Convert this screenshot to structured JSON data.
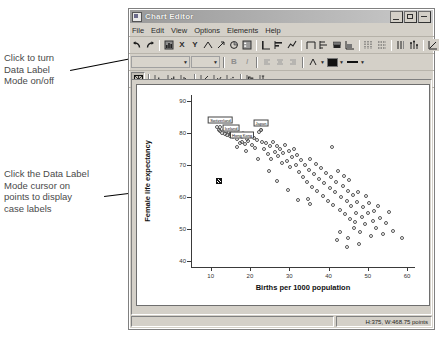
{
  "window": {
    "title": "Chart Editor",
    "icon": "chart-window-icon",
    "buttons": [
      {
        "name": "minimize",
        "glyph": "_"
      },
      {
        "name": "maximize",
        "glyph": "□"
      },
      {
        "name": "close",
        "glyph": "×"
      }
    ]
  },
  "menu": {
    "items": [
      "File",
      "Edit",
      "View",
      "Options",
      "Elements",
      "Help"
    ]
  },
  "toolbar1": {
    "groups": [
      [
        "undo-icon",
        "redo-icon"
      ],
      [
        "chart-properties-icon",
        "x-axis-icon",
        "y-axis-icon",
        "scale-axis-icon",
        "rotate-icon",
        "pie-icon",
        "legend-icon"
      ],
      [
        "bar-vertical-icon",
        "bar-horizontal-icon",
        "line-icon"
      ],
      [
        "area-outline-icon",
        "area-left-icon",
        "stacked-bar-icon",
        "stacked-area-icon"
      ],
      [
        "grid-major-icon",
        "grid-minor-icon"
      ],
      [
        "reference-line-icon",
        "spike-icon"
      ],
      [
        "fit-line-icon",
        "transpose-icon"
      ]
    ]
  },
  "toolbar2": {
    "font_combo_value": "",
    "size_combo_value": "",
    "bold_label": "B",
    "italic_label": "I",
    "align_icons": [
      "align-left-icon",
      "align-center-icon",
      "align-right-icon"
    ],
    "text_color_icon": "text-color-icon",
    "fill_color_swatch": "#111111",
    "line_style_icon": "line-style-icon"
  },
  "toolbar3": {
    "data_label_mode_icon": "data-label-mode-icon",
    "data_label_mode_pressed": true,
    "icons": [
      "bar-chart-icon",
      "bar-chart-alt-icon",
      "histogram-icon",
      "scatter-icon",
      "scatter-matrix-icon",
      "dot-plot-icon",
      "boxplot-icon",
      "error-bar-icon"
    ]
  },
  "annotations": [
    {
      "name": "callout-data-label-toggle",
      "text": "Click to turn\nData Label\nMode on/off"
    },
    {
      "name": "callout-data-label-cursor",
      "text": "Click the Data Label\nMode cursor on\npoints to display\ncase labels"
    }
  ],
  "statusbar": {
    "dimensions": "H:375, W:468.75 points"
  },
  "chart_data": {
    "type": "scatter",
    "title": "",
    "xlabel": "Births per 1000 population",
    "ylabel": "Female life expectancy",
    "xlim": [
      5,
      62
    ],
    "ylim": [
      38,
      92
    ],
    "xticks": [
      10,
      20,
      30,
      40,
      50,
      60
    ],
    "yticks": [
      40,
      50,
      60,
      70,
      80,
      90
    ],
    "grid": false,
    "legend": null,
    "marker": "open-circle",
    "point_labels": [
      {
        "label": "Switzerland",
        "x": 12.5,
        "y": 82.0
      },
      {
        "label": "Iceland",
        "x": 15.2,
        "y": 79.3
      },
      {
        "label": "Hong Kong",
        "x": 18.0,
        "y": 77.3
      },
      {
        "label": "Japan",
        "x": 22.8,
        "y": 81.0
      }
    ],
    "selected_point": {
      "name": "data-label-cursor",
      "x": 12.0,
      "y": 65.0
    },
    "points": [
      [
        11.7,
        81.8
      ],
      [
        12.2,
        80.9
      ],
      [
        12.4,
        80.6
      ],
      [
        12.9,
        80.2
      ],
      [
        13.3,
        81.1
      ],
      [
        13.6,
        79.9
      ],
      [
        14.0,
        80.8
      ],
      [
        14.2,
        79.4
      ],
      [
        14.6,
        80.3
      ],
      [
        15.0,
        79.1
      ],
      [
        15.3,
        80.0
      ],
      [
        15.6,
        78.7
      ],
      [
        16.0,
        79.8
      ],
      [
        16.4,
        80.5
      ],
      [
        16.8,
        78.3
      ],
      [
        17.1,
        79.6
      ],
      [
        17.4,
        77.0
      ],
      [
        17.9,
        78.9
      ],
      [
        18.3,
        80.1
      ],
      [
        18.8,
        76.6
      ],
      [
        19.2,
        78.2
      ],
      [
        19.6,
        77.5
      ],
      [
        20.1,
        79.0
      ],
      [
        20.5,
        76.2
      ],
      [
        21.0,
        78.6
      ],
      [
        21.4,
        75.5
      ],
      [
        21.9,
        77.8
      ],
      [
        22.3,
        80.4
      ],
      [
        22.7,
        80.9
      ],
      [
        23.1,
        77.1
      ],
      [
        23.6,
        74.9
      ],
      [
        24.0,
        76.8
      ],
      [
        24.5,
        73.6
      ],
      [
        25.0,
        75.9
      ],
      [
        25.4,
        71.9
      ],
      [
        25.9,
        77.4
      ],
      [
        26.3,
        74.2
      ],
      [
        26.8,
        76.0
      ],
      [
        27.2,
        72.8
      ],
      [
        27.6,
        75.0
      ],
      [
        28.1,
        70.6
      ],
      [
        28.5,
        73.9
      ],
      [
        29.0,
        76.3
      ],
      [
        29.4,
        71.2
      ],
      [
        29.9,
        74.5
      ],
      [
        30.3,
        69.3
      ],
      [
        30.8,
        72.4
      ],
      [
        31.2,
        75.2
      ],
      [
        31.7,
        70.1
      ],
      [
        32.1,
        73.1
      ],
      [
        32.6,
        67.8
      ],
      [
        33.0,
        71.5
      ],
      [
        33.5,
        66.3
      ],
      [
        34.0,
        69.9
      ],
      [
        34.4,
        64.8
      ],
      [
        34.9,
        68.4
      ],
      [
        35.3,
        71.8
      ],
      [
        35.8,
        63.2
      ],
      [
        36.2,
        67.1
      ],
      [
        36.7,
        70.4
      ],
      [
        37.1,
        61.9
      ],
      [
        37.6,
        65.7
      ],
      [
        38.0,
        69.0
      ],
      [
        38.5,
        60.4
      ],
      [
        38.9,
        64.3
      ],
      [
        39.4,
        67.6
      ],
      [
        39.8,
        58.8
      ],
      [
        40.3,
        62.9
      ],
      [
        40.7,
        66.2
      ],
      [
        41.1,
        57.4
      ],
      [
        41.6,
        61.5
      ],
      [
        42.0,
        64.8
      ],
      [
        42.4,
        68.1
      ],
      [
        42.8,
        55.9
      ],
      [
        43.2,
        60.1
      ],
      [
        43.6,
        63.4
      ],
      [
        44.0,
        66.7
      ],
      [
        44.3,
        54.5
      ],
      [
        44.6,
        58.7
      ],
      [
        44.9,
        62.0
      ],
      [
        45.2,
        65.3
      ],
      [
        45.5,
        53.1
      ],
      [
        45.8,
        57.3
      ],
      [
        46.1,
        60.6
      ],
      [
        46.4,
        50.4
      ],
      [
        46.7,
        52.0
      ],
      [
        47.0,
        55.1
      ],
      [
        47.3,
        58.4
      ],
      [
        47.6,
        61.7
      ],
      [
        48.0,
        49.1
      ],
      [
        48.4,
        53.6
      ],
      [
        48.8,
        56.9
      ],
      [
        49.2,
        51.5
      ],
      [
        49.6,
        60.2
      ],
      [
        50.0,
        54.8
      ],
      [
        50.4,
        58.1
      ],
      [
        50.8,
        47.6
      ],
      [
        51.2,
        52.4
      ],
      [
        51.6,
        55.7
      ],
      [
        52.0,
        50.2
      ],
      [
        52.6,
        57.0
      ],
      [
        53.2,
        53.5
      ],
      [
        53.8,
        48.3
      ],
      [
        54.6,
        51.9
      ],
      [
        55.4,
        55.2
      ],
      [
        56.4,
        49.4
      ],
      [
        58.6,
        47.0
      ],
      [
        41.0,
        75.8
      ],
      [
        34.8,
        59.4
      ],
      [
        35.4,
        57.8
      ],
      [
        32.2,
        58.9
      ],
      [
        29.6,
        62.2
      ],
      [
        27.0,
        65.0
      ],
      [
        24.8,
        68.2
      ],
      [
        22.0,
        72.0
      ],
      [
        19.0,
        74.4
      ],
      [
        16.6,
        75.6
      ],
      [
        43.0,
        48.9
      ],
      [
        45.0,
        47.2
      ],
      [
        47.8,
        45.1
      ],
      [
        44.8,
        44.3
      ],
      [
        42.2,
        46.5
      ]
    ]
  }
}
